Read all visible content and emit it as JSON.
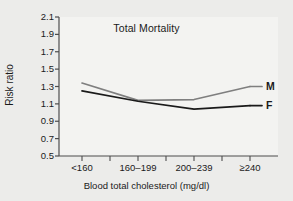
{
  "chart_data": {
    "type": "line",
    "title": "Total Mortality",
    "xlabel": "Blood total cholesterol (mg/dl)",
    "ylabel": "Risk ratio",
    "categories": [
      "<160",
      "160–199",
      "200–239",
      "≥240"
    ],
    "series": [
      {
        "name": "M",
        "label": "M",
        "color": "#7f7f7f",
        "values": [
          1.34,
          1.14,
          1.15,
          1.3
        ]
      },
      {
        "name": "F",
        "label": "F",
        "color": "#1a1a1a",
        "values": [
          1.25,
          1.13,
          1.04,
          1.08
        ]
      }
    ],
    "ylim": [
      0.5,
      2.1
    ],
    "ytick_labels": [
      "0.5",
      "0.7",
      "0.9",
      "1.1",
      "1.3",
      "1.5",
      "1.7",
      "1.9",
      "2.1"
    ],
    "ytick_values": [
      0.5,
      0.7,
      0.9,
      1.1,
      1.3,
      1.5,
      1.7,
      1.9,
      2.1
    ],
    "grid": false,
    "legend": "inline-right-end-labels"
  },
  "colors": {
    "background": "#ececea",
    "plot_background": "#f3f3f1",
    "axis": "#4d4d4d",
    "text": "#1a1a1a",
    "series_male": "#7f7f7f",
    "series_female": "#1a1a1a"
  }
}
